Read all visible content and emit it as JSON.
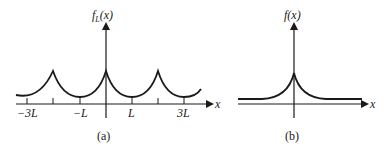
{
  "panel_a": {
    "ylabel_main": "f",
    "ylabel_sub": "L",
    "ylabel_arg": "(x)",
    "xlabel": "x",
    "ticks": [
      "−3L",
      "−L",
      "L",
      "3L"
    ],
    "caption": "(a)"
  },
  "panel_b": {
    "ylabel": "f(x)",
    "xlabel": "x",
    "caption": "(b)"
  }
}
